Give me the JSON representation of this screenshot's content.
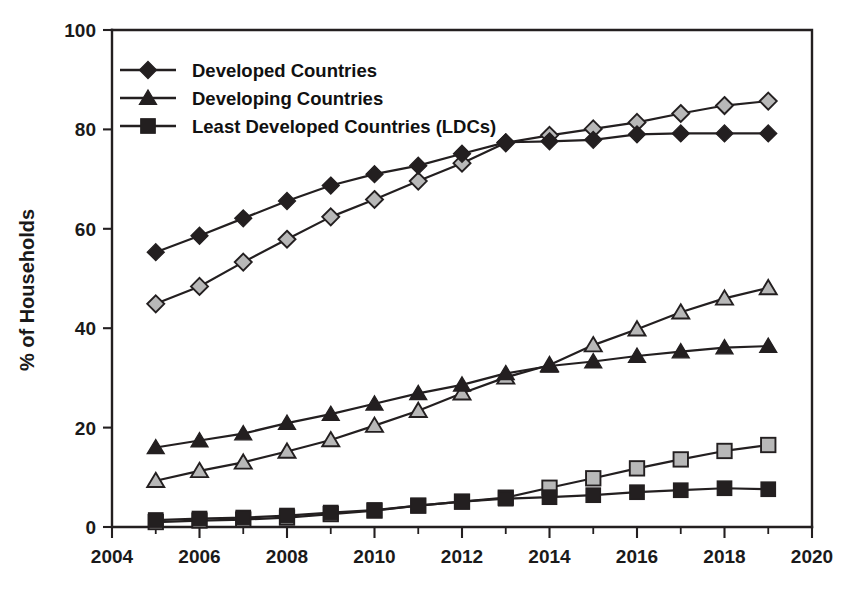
{
  "chart_data": {
    "type": "line",
    "title": "",
    "subtitle": "",
    "xlabel": "",
    "ylabel": "% of Households",
    "xlim": [
      2004,
      2020
    ],
    "ylim": [
      0,
      100
    ],
    "xticks": [
      2004,
      2006,
      2008,
      2010,
      2012,
      2014,
      2016,
      2018,
      2020
    ],
    "xtick_labels": [
      "2004",
      "2006",
      "2008",
      "2010",
      "2012",
      "2014",
      "2016",
      "2018",
      "2020"
    ],
    "xticks_minor": [
      2005,
      2007,
      2009,
      2011,
      2013,
      2015,
      2017,
      2019
    ],
    "yticks": [
      0,
      20,
      40,
      60,
      80,
      100
    ],
    "ytick_labels": [
      "0",
      "20",
      "40",
      "60",
      "80",
      "100"
    ],
    "grid": false,
    "legend_position": "upper-left-inside",
    "x": [
      2005,
      2006,
      2007,
      2008,
      2009,
      2010,
      2011,
      2012,
      2013,
      2014,
      2015,
      2016,
      2017,
      2018,
      2019
    ],
    "series": [
      {
        "name": "Developed Countries",
        "marker": "diamond",
        "fill": "dark",
        "in_legend": true,
        "values": [
          55.3,
          58.6,
          62.1,
          65.6,
          68.7,
          71.0,
          72.7,
          75.1,
          77.4,
          77.6,
          77.9,
          79.0,
          79.2,
          79.2,
          79.2
        ]
      },
      {
        "name": "Developed Countries (second estimate)",
        "marker": "diamond",
        "fill": "gray",
        "in_legend": false,
        "values": [
          44.9,
          48.4,
          53.3,
          57.9,
          62.4,
          65.9,
          69.6,
          73.2,
          77.3,
          78.8,
          80.1,
          81.4,
          83.2,
          84.8,
          85.7
        ]
      },
      {
        "name": "Developing Countries",
        "marker": "triangle",
        "fill": "dark",
        "in_legend": true,
        "values": [
          16.0,
          17.4,
          18.8,
          20.9,
          22.7,
          24.8,
          26.9,
          28.6,
          30.9,
          32.4,
          33.3,
          34.4,
          35.3,
          36.1,
          36.4
        ]
      },
      {
        "name": "Developing Countries (second estimate)",
        "marker": "triangle",
        "fill": "gray",
        "in_legend": false,
        "values": [
          9.3,
          11.3,
          13.0,
          15.2,
          17.5,
          20.4,
          23.4,
          26.9,
          30.1,
          32.6,
          36.6,
          39.8,
          43.2,
          46.0,
          48.1
        ]
      },
      {
        "name": "Least Developed Countries (LDCs)",
        "marker": "square",
        "fill": "dark",
        "in_legend": true,
        "values": [
          1.4,
          1.7,
          1.9,
          2.3,
          2.9,
          3.4,
          4.3,
          5.1,
          5.7,
          6.0,
          6.4,
          7.0,
          7.4,
          7.8,
          7.6
        ]
      },
      {
        "name": "Least Developed Countries (LDCs) (second estimate)",
        "marker": "square",
        "fill": "gray",
        "in_legend": false,
        "values": [
          1.0,
          1.3,
          1.5,
          1.9,
          2.6,
          3.3,
          4.3,
          5.1,
          5.9,
          7.9,
          9.8,
          11.8,
          13.6,
          15.3,
          16.5
        ]
      }
    ],
    "legend": [
      {
        "label": "Developed Countries",
        "marker": "diamond",
        "fill": "dark"
      },
      {
        "label": "Developing Countries",
        "marker": "triangle",
        "fill": "dark"
      },
      {
        "label": "Least Developed Countries (LDCs)",
        "marker": "square",
        "fill": "dark"
      }
    ],
    "colors": {
      "dark_marker": "#231f20",
      "gray_marker": "#b8b8b8",
      "line": "#231f20",
      "axis": "#231f20",
      "background": "#ffffff"
    }
  }
}
